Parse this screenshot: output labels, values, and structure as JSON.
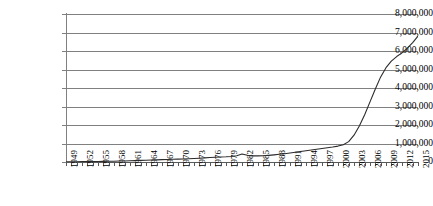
{
  "chart_data": {
    "type": "line",
    "title": "",
    "subtitle": "",
    "xlabel": "",
    "ylabel": "",
    "grid": true,
    "legend": false,
    "legend_position": "none",
    "xlim": [
      1949,
      2015
    ],
    "ylim": [
      0,
      8000000
    ],
    "ytick_step": 1000000,
    "xtick_step": 1,
    "xlabel_step": 3,
    "line_color": "#2b2b2b",
    "grid_color": "#808080",
    "ytick_labels": [
      "8,000,000",
      "7,000,000",
      "6,000,000",
      "5,000,000",
      "4,000,000",
      "3,000,000",
      "2,000,000",
      "1,000,000",
      "0"
    ],
    "ytick_values": [
      8000000,
      7000000,
      6000000,
      5000000,
      4000000,
      3000000,
      2000000,
      1000000,
      0
    ],
    "xtick_labels": [
      "1949",
      "1952",
      "1955",
      "1958",
      "1961",
      "1964",
      "1967",
      "1970",
      "1973",
      "1976",
      "1979",
      "1982",
      "1985",
      "1988",
      "1991",
      "1994",
      "1997",
      "2000",
      "2003",
      "2006",
      "2009",
      "2012",
      "2015"
    ],
    "series": [
      {
        "name": "",
        "x": [
          1949,
          1950,
          1951,
          1952,
          1953,
          1954,
          1955,
          1956,
          1957,
          1958,
          1959,
          1960,
          1961,
          1962,
          1963,
          1964,
          1965,
          1966,
          1967,
          1968,
          1969,
          1970,
          1971,
          1972,
          1973,
          1974,
          1975,
          1976,
          1977,
          1978,
          1979,
          1980,
          1981,
          1982,
          1983,
          1984,
          1985,
          1986,
          1987,
          1988,
          1989,
          1990,
          1991,
          1992,
          1993,
          1994,
          1995,
          1996,
          1997,
          1998,
          1999,
          2000,
          2001,
          2002,
          2003,
          2004,
          2005,
          2006,
          2007,
          2008,
          2009,
          2010,
          2011,
          2012,
          2013,
          2014,
          2015
        ],
        "values": [
          12000,
          14000,
          16000,
          18000,
          21000,
          24000,
          28000,
          32000,
          37000,
          43000,
          50000,
          58000,
          67000,
          76000,
          86000,
          96000,
          106000,
          116000,
          126000,
          136000,
          146000,
          156000,
          166000,
          176000,
          190000,
          205000,
          222000,
          240000,
          258000,
          272000,
          282000,
          300000,
          340000,
          430000,
          360000,
          330000,
          330000,
          340000,
          360000,
          385000,
          415000,
          450000,
          490000,
          530000,
          570000,
          610000,
          650000,
          690000,
          730000,
          770000,
          810000,
          860000,
          930000,
          1100000,
          1450000,
          1950000,
          2550000,
          3250000,
          3950000,
          4600000,
          5100000,
          5450000,
          5700000,
          5900000,
          6150000,
          6450000,
          6800000
        ]
      }
    ]
  }
}
